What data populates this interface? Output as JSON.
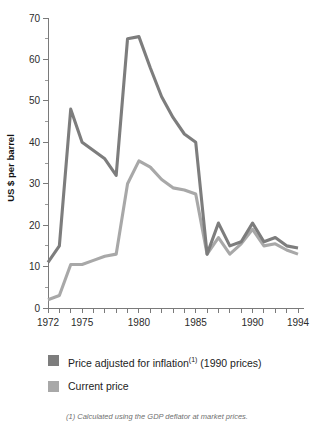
{
  "chart_data": {
    "type": "line",
    "title": "",
    "xlabel": "",
    "ylabel": "US $ per barrel",
    "ylim": [
      0,
      70
    ],
    "ytick_step": 10,
    "yminor_step": 5,
    "xlim": [
      1972,
      1994
    ],
    "grid": false,
    "legend_position": "below-plot",
    "yticks": [
      "0",
      "10",
      "20",
      "30",
      "40",
      "50",
      "60",
      "70"
    ],
    "x": [
      1972,
      1973,
      1974,
      1975,
      1976,
      1977,
      1978,
      1979,
      1980,
      1981,
      1982,
      1983,
      1984,
      1985,
      1986,
      1987,
      1988,
      1989,
      1990,
      1991,
      1992,
      1993,
      1994
    ],
    "xtick_labels": [
      "1972",
      "1975",
      "1980",
      "1985",
      "1990",
      "1994"
    ],
    "xtick_label_values": [
      1972,
      1975,
      1980,
      1985,
      1990,
      1994
    ],
    "series": [
      {
        "name": "Price adjusted for inflation",
        "name_sup": "(1)",
        "name_suffix": " (1990 prices)",
        "color": "#7d7d7d",
        "values": [
          11,
          15,
          48,
          40,
          38,
          36,
          32,
          65,
          65.5,
          58,
          51,
          46,
          42,
          40,
          13,
          20.5,
          15,
          16,
          20.5,
          16,
          17,
          15,
          14.5
        ]
      },
      {
        "name": "Current price",
        "name_sup": "",
        "name_suffix": "",
        "color": "#a8a8a8",
        "values": [
          2,
          3,
          10.5,
          10.5,
          11.5,
          12.5,
          13,
          30,
          35.5,
          34,
          31,
          29,
          28.5,
          27.5,
          13,
          17,
          13,
          15.5,
          19,
          15,
          15.5,
          14,
          13
        ]
      }
    ],
    "footnote": "(1) Calculated using the GDP deflator at market prices."
  },
  "legend": {
    "items": [
      {
        "label_main": "Price adjusted for inflation",
        "sup": "(1)",
        "label_tail": " (1990 prices)",
        "color": "#7d7d7d"
      },
      {
        "label_main": "Current price",
        "sup": "",
        "label_tail": "",
        "color": "#a8a8a8"
      }
    ]
  },
  "axis": {
    "y_title": "US $ per barrel"
  }
}
